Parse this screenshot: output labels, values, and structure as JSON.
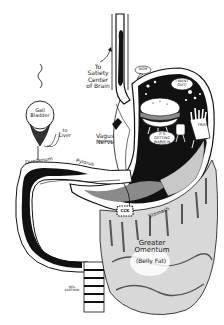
{
  "illustration": {
    "subject": "Cartoon diagram of stomach, digestive tract and greater omentum",
    "colors": {
      "ink": "#111111",
      "paper": "#ffffff",
      "shade": "#8a8a8a",
      "light_shade": "#c8c8c8"
    }
  },
  "labels": {
    "satiety": "To\nSatiety\nCenter\nof Brain",
    "gall_bladder": "Gall\nBladder",
    "to_liver": "to\nLiver",
    "vagus_nerve": "Vagus\nNerve",
    "duodenum": "Duodenum",
    "pylorus": "Pylorus",
    "stomach": "Stomach",
    "greater_omentum": "Greater\nOmentum",
    "belly_fat": "(Belly Fat)",
    "signature": "NEIL\nKARTMAN"
  },
  "speech_bubbles": {
    "nom": "NOM",
    "want_out": "I WANT\nOUT!",
    "getting_warm": "IT'S\nGETTING\nWARM IN HERE!"
  },
  "characters": {
    "burger": "hamburger character",
    "fries": "french fries character",
    "fries_label": "FRIES",
    "ccx_box": "CCK"
  }
}
